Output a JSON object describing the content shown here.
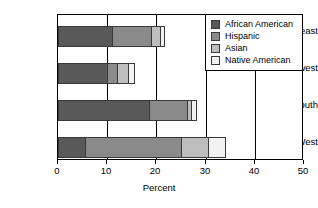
{
  "chart_data": {
    "type": "bar",
    "orientation": "horizontal",
    "stacked": true,
    "title": "",
    "xlabel": "Percent",
    "ylabel": "",
    "xlim": [
      0,
      50
    ],
    "xticks": [
      0,
      10,
      20,
      30,
      40,
      50
    ],
    "xticklabels": [
      "0",
      "10",
      "20",
      "30",
      "40",
      "50"
    ],
    "grid": "vertical",
    "legend_position": "upper right",
    "categories": [
      "Northeast",
      "Midwest",
      "South",
      "West"
    ],
    "series": [
      {
        "name": "African American",
        "color": "#595959",
        "values": [
          11.0,
          10.0,
          18.5,
          5.5
        ]
      },
      {
        "name": "Hispanic",
        "color": "#8a8a8a",
        "values": [
          8.0,
          2.0,
          7.7,
          19.5
        ]
      },
      {
        "name": "Asian",
        "color": "#bdbdbd",
        "values": [
          1.8,
          2.2,
          0.9,
          5.5
        ]
      },
      {
        "name": "Native American",
        "color": "#f2f2f2",
        "values": [
          0.7,
          1.3,
          0.9,
          3.5
        ]
      }
    ],
    "totals": [
      21.5,
      15.5,
      28.0,
      34.0
    ]
  },
  "legend": {
    "entries": [
      {
        "label": "African American",
        "color": "#595959"
      },
      {
        "label": "Hispanic",
        "color": "#8a8a8a"
      },
      {
        "label": "Asian",
        "color": "#bdbdbd"
      },
      {
        "label": "Native American",
        "color": "#f2f2f2"
      }
    ]
  }
}
